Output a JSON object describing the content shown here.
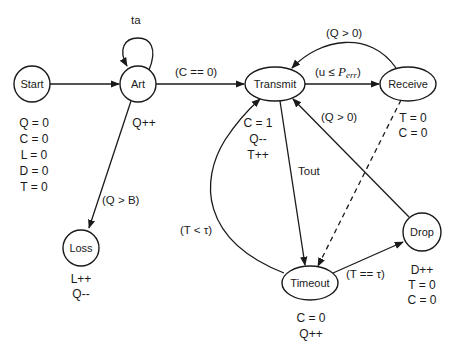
{
  "diagram": {
    "type": "state-machine",
    "nodes": {
      "start": {
        "label": "Start",
        "actions": [
          "Q = 0",
          "C = 0",
          "L = 0",
          "D = 0",
          "T = 0"
        ]
      },
      "art": {
        "label": "Art",
        "actions": [
          "Q++"
        ]
      },
      "transmit": {
        "label": "Transmit",
        "actions": [
          "C = 1",
          "Q--",
          "T++"
        ]
      },
      "receive": {
        "label": "Receive",
        "actions": [
          "T = 0",
          "C = 0"
        ]
      },
      "loss": {
        "label": "Loss",
        "actions": [
          "L++",
          "Q--"
        ]
      },
      "timeout": {
        "label": "Timeout",
        "actions": [
          "C = 0",
          "Q++"
        ]
      },
      "drop": {
        "label": "Drop",
        "actions": [
          "D++",
          "T = 0",
          "C = 0"
        ]
      }
    },
    "edges": {
      "start_art": {
        "from": "Start",
        "to": "Art",
        "label": ""
      },
      "art_self": {
        "from": "Art",
        "to": "Art",
        "label": "ta"
      },
      "art_transmit": {
        "from": "Art",
        "to": "Transmit",
        "label": "(C == 0)"
      },
      "art_loss": {
        "from": "Art",
        "to": "Loss",
        "label": "(Q > B)"
      },
      "transmit_receive": {
        "from": "Transmit",
        "to": "Receive",
        "label_prefix": "(u  ≤  ",
        "label_var": "P",
        "label_sub": "err",
        "label_suffix": ")"
      },
      "receive_transmit": {
        "from": "Receive",
        "to": "Transmit",
        "label": "(Q > 0)"
      },
      "transmit_timeout": {
        "from": "Transmit",
        "to": "Timeout",
        "label": "Tout"
      },
      "receive_timeout": {
        "from": "Receive",
        "to": "Timeout",
        "label": "",
        "style": "dashed"
      },
      "drop_transmit": {
        "from": "Drop",
        "to": "Transmit",
        "label": "(Q > 0)"
      },
      "timeout_transmit": {
        "from": "Timeout",
        "to": "Transmit",
        "label": "(T < τ)"
      },
      "timeout_drop": {
        "from": "Timeout",
        "to": "Drop",
        "label": "(T == τ)"
      }
    }
  }
}
